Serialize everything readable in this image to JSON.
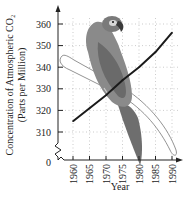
{
  "chart_data": {
    "type": "line",
    "title": "",
    "xlabel": "Year",
    "ylabel_lines": [
      "Concentration of Atmospheric CO₂",
      "(Parts per Million)"
    ],
    "ylabel": "Concentration of Atmospheric CO2 (Parts per Million)",
    "x": [
      1960,
      1965,
      1970,
      1975,
      1980,
      1985,
      1990
    ],
    "series": [
      {
        "name": "Atmospheric CO2",
        "values": [
          315,
          321,
          327,
          334,
          340,
          347,
          356
        ]
      }
    ],
    "xticks": [
      "1960",
      "1965",
      "1970",
      "1975",
      "1980",
      "1985",
      "1990"
    ],
    "yticks": [
      "310",
      "320",
      "330",
      "340",
      "350",
      "360"
    ],
    "y_zero_label": "0",
    "xlim": [
      1957,
      1991
    ],
    "ylim": [
      310,
      362
    ],
    "axis_break": "y-axis break between 0 and 310",
    "grid": true,
    "legend": "none",
    "background_image": "parrot perched on branch (illustration)",
    "line_color": "#1a1a1a"
  }
}
